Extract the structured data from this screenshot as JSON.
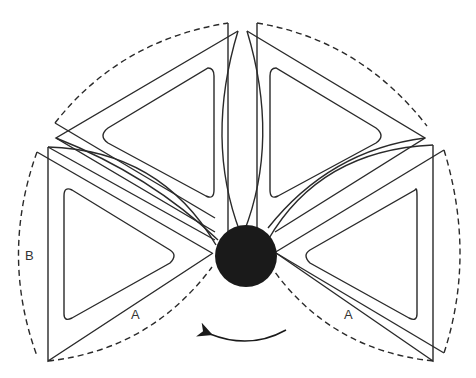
{
  "diagram": {
    "title": "",
    "labels": {
      "left_outer_arc": "B",
      "left_lower_edge": "A",
      "right_lower_edge": "A"
    },
    "hub": {
      "name": "central-hub",
      "color": "#1a1a1a"
    },
    "blades": [
      {
        "name": "left-blade"
      },
      {
        "name": "top-left-blade"
      },
      {
        "name": "top-right-blade"
      },
      {
        "name": "right-blade"
      }
    ],
    "rotation_direction": "counterclockwise",
    "colors": {
      "stroke": "#2a2a2a",
      "background": "#ffffff"
    }
  }
}
